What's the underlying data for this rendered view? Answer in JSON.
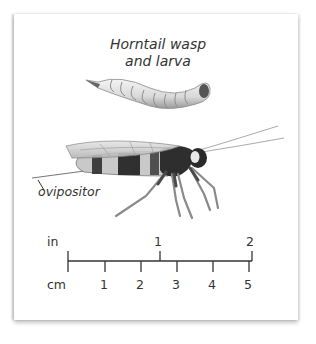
{
  "figure": {
    "title_line1": "Horntail wasp",
    "title_line2": "and larva",
    "callout": "ovipositor",
    "subjects": [
      "larva-illustration",
      "wasp-illustration"
    ]
  },
  "scale_bar": {
    "inch_unit": "in",
    "cm_unit": "cm",
    "inch_labels": [
      "1",
      "2"
    ],
    "cm_labels": [
      "1",
      "2",
      "3",
      "4",
      "5"
    ]
  }
}
